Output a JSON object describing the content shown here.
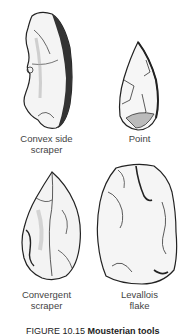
{
  "figure": {
    "tools": [
      {
        "name": "Convex side scraper",
        "line1": "Convex side",
        "line2": "scraper"
      },
      {
        "name": "Point",
        "line1": "Point",
        "line2": ""
      },
      {
        "name": "Convergent scraper",
        "line1": "Convergent",
        "line2": "scraper"
      },
      {
        "name": "Levallois flake",
        "line1": "Levallois",
        "line2": "flake"
      }
    ],
    "caption": {
      "number": "FIGURE 10.15",
      "text": "Mousterian tools"
    }
  }
}
